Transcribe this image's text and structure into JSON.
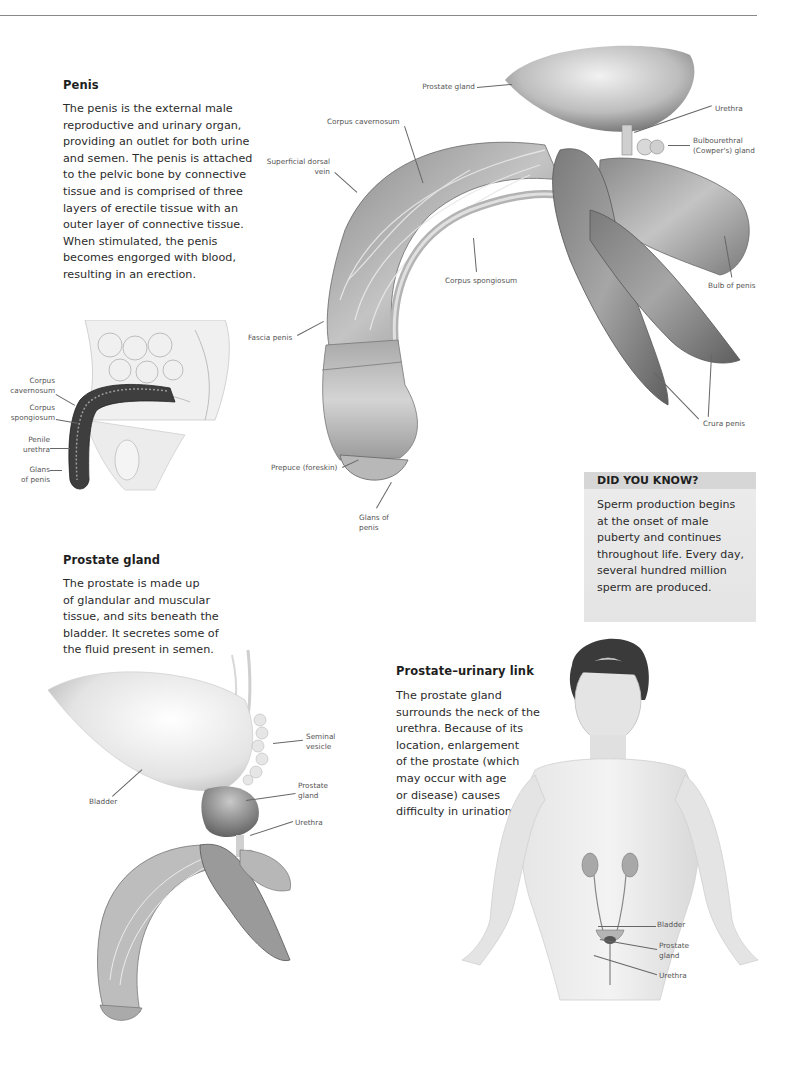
{
  "page": {
    "top_rule": true
  },
  "penis_section": {
    "title": "Penis",
    "body_lines": [
      "The penis is the external male",
      "reproductive and urinary organ,",
      "providing an outlet for both urine",
      "and semen. The penis is attached",
      "to the pelvic bone by connective",
      "tissue and is comprised of three",
      "layers of erectile tissue with an",
      "outer layer of connective tissue.",
      "When stimulated, the penis",
      "becomes engorged with blood,",
      "resulting in an erection."
    ]
  },
  "main_illustration": {
    "labels": {
      "prostate_gland": "Prostate gland",
      "urethra": "Urethra",
      "bulbourethral_1": "Bulbourethral",
      "bulbourethral_2": "(Cowper's) gland",
      "corpus_cavernosum": "Corpus cavernosum",
      "superficial_dorsal_1": "Superficial dorsal",
      "superficial_dorsal_2": "vein",
      "corpus_spongiosum": "Corpus spongiosum",
      "bulb_of_penis": "Bulb of penis",
      "fascia_penis": "Fascia penis",
      "crura_penis": "Crura penis",
      "prepuce": "Prepuce (foreskin)",
      "glans_1": "Glans of",
      "glans_2": "penis"
    }
  },
  "side_view": {
    "labels": {
      "cavernosum_1": "Corpus",
      "cavernosum_2": "cavernosum",
      "spongiosum_1": "Corpus",
      "spongiosum_2": "spongiosum",
      "urethra_1": "Penile",
      "urethra_2": "urethra",
      "glans_1": "Glans",
      "glans_2": "of penis"
    }
  },
  "did_you_know": {
    "title": "DID YOU KNOW?",
    "lines": [
      "Sperm production begins",
      "at the onset of male",
      "puberty and continues",
      "throughout life. Every day,",
      "several hundred million",
      "sperm are produced."
    ]
  },
  "prostate_section": {
    "title": "Prostate gland",
    "body_lines": [
      "The prostate is made up",
      "of glandular and muscular",
      "tissue, and sits beneath the",
      "bladder. It secretes some of",
      "the fluid present in semen."
    ],
    "labels": {
      "seminal_1": "Seminal",
      "seminal_2": "vesicle",
      "bladder": "Bladder",
      "prostate_1": "Prostate",
      "prostate_2": "gland",
      "urethra": "Urethra"
    }
  },
  "link_section": {
    "title": "Prostate–urinary link",
    "body_lines": [
      "The prostate gland",
      "surrounds the neck of the",
      "urethra. Because of its",
      "location, enlargement",
      "of the prostate (which",
      "may occur with age",
      "or disease) causes",
      "difficulty in urination."
    ],
    "labels": {
      "bladder": "Bladder",
      "prostate_1": "Prostate",
      "prostate_2": "gland",
      "urethra": "Urethra"
    }
  }
}
